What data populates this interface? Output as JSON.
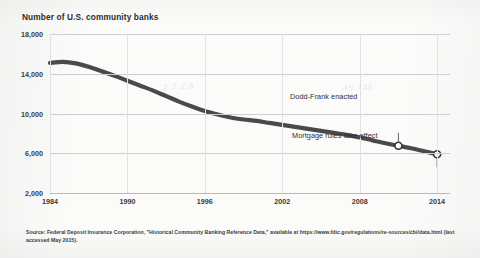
{
  "figure": {
    "source_note": "Source: Federal Deposit Insurance Corporation, \"Historical Community Banking Reference Data,\" available at https://www.fdic.gov/regulations/re-sources/cbi/data.html (last accessed May 2015).",
    "artifacts": {
      "a": "2,2,2,8",
      "b": "45,746",
      "c": "·"
    }
  },
  "chart_data": {
    "type": "line",
    "title": "Number of U.S. community banks",
    "xlabel": "",
    "ylabel": "",
    "grid": true,
    "legend": "none",
    "line_color": "#4a4a4a",
    "xlim": [
      1984,
      2015
    ],
    "ylim": [
      2000,
      18000
    ],
    "ytick_labels": [
      "18,000",
      "14,000",
      "10,000",
      "6,000",
      "2,000"
    ],
    "yticks": [
      18000,
      14000,
      10000,
      6000,
      2000
    ],
    "xtick_labels": [
      "1984",
      "1990",
      "1996",
      "2002",
      "2008",
      "2014"
    ],
    "xticks": [
      1984,
      1990,
      1996,
      2002,
      2008,
      2014
    ],
    "x": [
      1984,
      1985,
      1986,
      1987,
      1988,
      1989,
      1990,
      1991,
      1992,
      1993,
      1994,
      1995,
      1996,
      1997,
      1998,
      1999,
      2000,
      2001,
      2002,
      2003,
      2004,
      2005,
      2006,
      2007,
      2008,
      2009,
      2010,
      2011,
      2012,
      2013,
      2014
    ],
    "values": [
      15100,
      15200,
      15050,
      14700,
      14250,
      13800,
      13300,
      12800,
      12300,
      11750,
      11200,
      10700,
      10250,
      9900,
      9600,
      9400,
      9250,
      9050,
      8850,
      8650,
      8450,
      8250,
      8050,
      7850,
      7600,
      7300,
      7000,
      6750,
      6500,
      6200,
      5900
    ],
    "annotations": [
      {
        "id": "dodd-frank",
        "label": "Dodd-Frank enacted",
        "x": 2011,
        "y": 6750,
        "marker": "open-circle",
        "label_position": "above"
      },
      {
        "id": "mortgage-rules",
        "label": "Mortgage rules take effect",
        "x": 2014,
        "y": 5900,
        "marker": "open-circle",
        "label_position": "below"
      }
    ]
  }
}
